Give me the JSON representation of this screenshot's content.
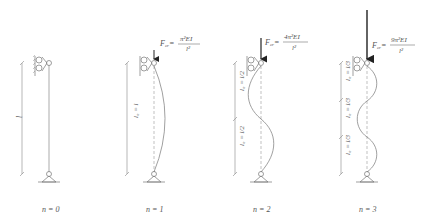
{
  "figure": {
    "panels": [
      {
        "id": "n0",
        "caption": "n = 0",
        "length_labels": [
          "l"
        ],
        "formula": null,
        "x": 49
      },
      {
        "id": "n1",
        "caption": "n = 1",
        "length_labels": [
          "l₀ = l"
        ],
        "formula": {
          "lhs": "F",
          "sub": "cr",
          "num": "π²EI",
          "den": "l²"
        },
        "x": 154
      },
      {
        "id": "n2",
        "caption": "n = 2",
        "length_labels": [
          "l₀ = l/2",
          "l₀ = l/2"
        ],
        "formula": {
          "lhs": "F",
          "sub": "cr",
          "num": "4π²EI",
          "den": "l²"
        },
        "x": 261
      },
      {
        "id": "n3",
        "caption": "n = 3",
        "length_labels": [
          "l₀ = l/3",
          "l₀ = l/3",
          "l₀ = l/3"
        ],
        "formula": {
          "lhs": "F",
          "sub": "cr",
          "num": "9π²EI",
          "den": "l²"
        },
        "x": 367
      }
    ]
  }
}
